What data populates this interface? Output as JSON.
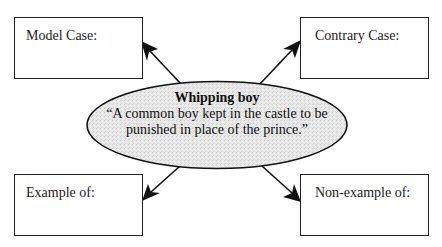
{
  "diagram": {
    "type": "concept-attainment-map",
    "center": {
      "term": "Whipping boy",
      "definition": "“A common boy kept in the castle to be punished in place of the prince.”",
      "fill_color": "#e4e4e4",
      "stroke_color": "#111111"
    },
    "boxes": {
      "top_left": {
        "label": "Model Case:"
      },
      "top_right": {
        "label": "Contrary Case:"
      },
      "bottom_left": {
        "label": "Example of:"
      },
      "bottom_right": {
        "label": "Non-example of:"
      }
    },
    "arrows": [
      {
        "from": "center",
        "to": "top_left"
      },
      {
        "from": "center",
        "to": "top_right"
      },
      {
        "from": "center",
        "to": "bottom_left"
      },
      {
        "from": "center",
        "to": "bottom_right"
      }
    ],
    "colors": {
      "line": "#111111",
      "box_border": "#222222",
      "background": "#ffffff"
    }
  }
}
